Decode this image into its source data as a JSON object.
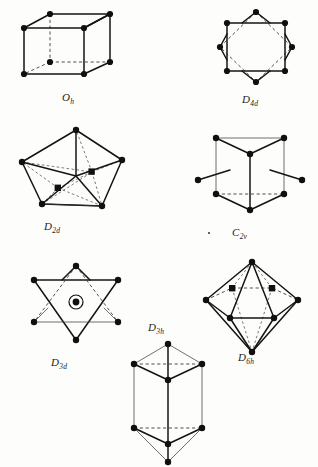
{
  "figure": {
    "background_color": "#fdfdfb",
    "ink_color": "#141414",
    "panels": [
      {
        "id": "oh",
        "label": "O",
        "label_sub": "h",
        "shape_name": "cube",
        "geometry": "cube",
        "vertex_count": 8,
        "vertex_marker": "filled-circle",
        "has_dashed_hidden_edges": true,
        "has_interior_markers": false,
        "caption_position": "below-center"
      },
      {
        "id": "d4d",
        "label": "D",
        "label_sub": "4d",
        "shape_name": "square antiprism",
        "geometry": "two interpenetrating squares forming eight-pointed star",
        "vertex_count": 8,
        "vertex_marker": "filled-circle",
        "has_dashed_hidden_edges": true,
        "has_interior_markers": false,
        "caption_position": "below-center"
      },
      {
        "id": "d2d",
        "label": "D",
        "label_sub": "2d",
        "shape_name": "dodecahedron",
        "geometry": "triangulated dodecahedron viewed near the S4 axis",
        "vertex_count": 8,
        "vertex_marker": "filled-circle",
        "has_dashed_hidden_edges": true,
        "has_interior_markers": true,
        "interior_marker_count": 2,
        "interior_marker_shape": "filled-square",
        "caption_position": "below-center"
      },
      {
        "id": "c2v",
        "label": "C",
        "label_sub": "2v",
        "shape_name": "bicapped trigonal prism",
        "geometry": "trigonal prism with two capping atoms on rectangular faces",
        "vertex_count": 8,
        "vertex_marker": "filled-circle",
        "has_dashed_hidden_edges": true,
        "has_interior_markers": false,
        "cap_count": 2,
        "caption_position": "below-center"
      },
      {
        "id": "d3d",
        "label": "D",
        "label_sub": "3d",
        "shape_name": "octahedron",
        "geometry": "octahedron viewed down the three-fold axis, star of david outline",
        "vertex_count": 6,
        "vertex_marker": "filled-circle",
        "has_dashed_hidden_edges": true,
        "has_interior_markers": true,
        "interior_marker_count": 1,
        "interior_marker_shape": "circled-dot",
        "caption_position": "below-center"
      },
      {
        "id": "d3h",
        "label": "D",
        "label_sub": "3h",
        "shape_name": "tricapped trigonal prism",
        "geometry": "trigonal prism capped above and below",
        "vertex_count": 8,
        "vertex_marker": "filled-circle",
        "has_dashed_hidden_edges": true,
        "has_interior_markers": false,
        "caption_position": "above-center"
      },
      {
        "id": "d6h",
        "label": "D",
        "label_sub": "6h",
        "shape_name": "hexagonal bipyramid",
        "geometry": "hexagonal bipyramid with interior atoms",
        "vertex_count": 8,
        "vertex_marker": "filled-circle",
        "has_dashed_hidden_edges": true,
        "has_interior_markers": true,
        "interior_marker_count": 2,
        "interior_marker_shape": "filled-square",
        "caption_position": "below-center"
      }
    ]
  }
}
